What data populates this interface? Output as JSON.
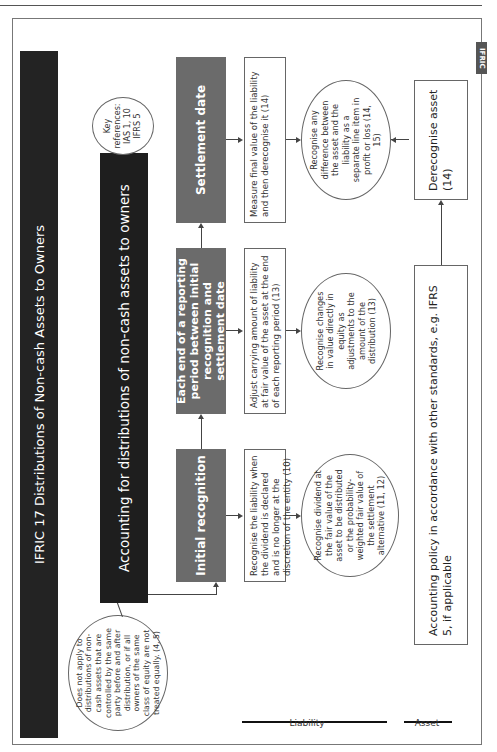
{
  "page": {
    "tab_label": "IFRIC"
  },
  "diagram": {
    "title": "IFRIC 17 Distributions of Non-cash Assets to Owners",
    "main_box": "Accounting for distributions of non-cash assets to owners",
    "key_references": "Key references: IAS 1, 10 IFRS 5",
    "scope_exclusion": "Does not apply to distributions of non-cash assets that are controlled by the same party before and after distribution, or if all owners of the same class of equity are not treated equally. (4, 5)",
    "phases": [
      {
        "label": "Initial recognition",
        "liability_text": "Recognise the liability when the dividend is declared and is no longer at the discretion of the entity (10)",
        "outcome": "Recognise dividend at the fair value of the asset to be distributed or the probability-weighted fair value of the settlement alternative (11, 12)"
      },
      {
        "label": "Each end of a reporting period between initial recognition and settlement date",
        "liability_text": "Adjust carrying amount of liability at fair value of the asset at the end of each reporting period (13)",
        "outcome": "Recognise changes in value directly in equity as adjustments to the amount of the distribution (13)"
      },
      {
        "label": "Settlement date",
        "liability_text": "Measure final value of the liability and then derecognise it (14)",
        "outcome": "Recognise any difference between the asset and the liability as a separate line item in profit or loss (14, 15)"
      }
    ],
    "asset_policy": "Accounting policy in accordance with other standards, e.g. IFRS 5, if applicable",
    "asset_derecognise": "Derecognise asset (14)",
    "legend": {
      "liability": "Liability",
      "asset": "Asset"
    }
  }
}
